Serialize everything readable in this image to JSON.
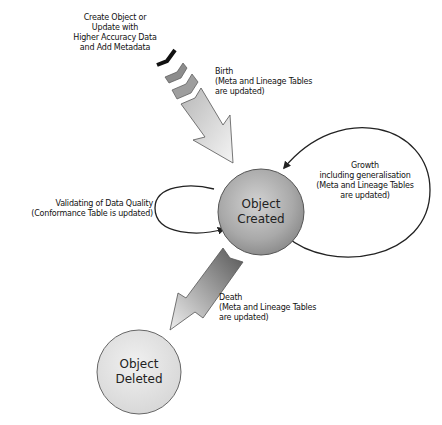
{
  "diagram": {
    "nodes": [
      {
        "id": "object-created",
        "lines": [
          "Object",
          "Created"
        ]
      },
      {
        "id": "object-deleted",
        "lines": [
          "Object",
          "Deleted"
        ]
      }
    ],
    "labels": {
      "create": [
        "Create Object or",
        "Update with",
        "Higher Accuracy Data",
        "and Add Metadata"
      ],
      "birth": [
        "Birth",
        "(Meta and Lineage Tables",
        "are updated)"
      ],
      "growth": [
        "Growth",
        "including generalisation",
        "(Meta and Lineage Tables",
        "are updated)"
      ],
      "validation": [
        "Validating of Data Quality",
        "(Conformance Table is updated)"
      ],
      "death": [
        "Death",
        "(Meta and Lineage Tables",
        "are updated)"
      ]
    },
    "edges": [
      {
        "from": "source",
        "to": "object-created",
        "label": "birth",
        "style": "block-arrow-with-chevrons"
      },
      {
        "from": "object-created",
        "to": "object-created",
        "label": "growth",
        "style": "loop-right"
      },
      {
        "from": "object-created",
        "to": "object-created",
        "label": "validation",
        "style": "loop-left"
      },
      {
        "from": "object-created",
        "to": "object-deleted",
        "label": "death",
        "style": "block-arrow"
      }
    ],
    "colors": {
      "created_fill": "#a8a8a8",
      "deleted_fill": "#e4e4e4",
      "stroke": "#333333",
      "birth_arrow": "#d8d8d8",
      "death_arrow": "#7a7a7a"
    }
  }
}
